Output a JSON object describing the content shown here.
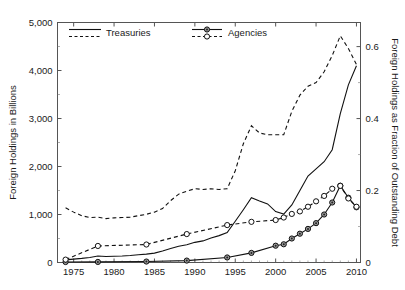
{
  "chart_data": {
    "type": "line",
    "title": "",
    "xlabel": "",
    "ylabel": "Foreign Holdings in Billions",
    "y2label": "Foreign Holdings as Fraction of Outstanding Debt",
    "xlim": [
      1973,
      2010.5
    ],
    "ylim": [
      0,
      5000
    ],
    "y2lim": [
      0,
      0.667
    ],
    "xticks": [
      1975,
      1980,
      1985,
      1990,
      1995,
      2000,
      2005,
      2010
    ],
    "xticklabels": [
      "1975",
      "1980",
      "1985",
      "1990",
      "1995",
      "2000",
      "2005",
      "2010"
    ],
    "yticks": [
      0,
      1000,
      2000,
      3000,
      4000,
      5000
    ],
    "yticklabels": [
      "0",
      "1,000",
      "2,000",
      "3,000",
      "4,000",
      "5,000"
    ],
    "y2ticks": [
      0,
      0.2,
      0.4,
      0.6
    ],
    "y2ticklabels": [
      "0",
      "0.2",
      "0.4",
      "0.6"
    ],
    "grid": false,
    "legend_position": "top-inside",
    "legend": [
      {
        "label": "Treasuries",
        "style": "solid-line",
        "axis": "left"
      },
      {
        "label": "Treasuries",
        "style": "dashed-line",
        "axis": "right"
      },
      {
        "label": "Agencies",
        "style": "solid-line-filled-circle",
        "axis": "left"
      },
      {
        "label": "Agencies",
        "style": "dashed-line-open-circle",
        "axis": "right"
      }
    ],
    "series": [
      {
        "name": "Treasuries (Billions)",
        "axis": "left",
        "style": "solid",
        "marker": "none",
        "x": [
          1974,
          1975,
          1976,
          1977,
          1978,
          1979,
          1980,
          1981,
          1982,
          1983,
          1984,
          1985,
          1986,
          1987,
          1988,
          1989,
          1990,
          1991,
          1992,
          1993,
          1994,
          1995,
          1996,
          1997,
          1998,
          1999,
          2000,
          2001,
          2002,
          2003,
          2004,
          2005,
          2006,
          2007,
          2008,
          2009,
          2010
        ],
        "y": [
          55,
          70,
          85,
          105,
          135,
          125,
          130,
          135,
          145,
          160,
          175,
          195,
          240,
          290,
          340,
          370,
          420,
          450,
          510,
          560,
          625,
          860,
          1100,
          1350,
          1280,
          1220,
          1060,
          1010,
          1200,
          1500,
          1800,
          1950,
          2100,
          2350,
          3100,
          3700,
          4100
        ]
      },
      {
        "name": "Treasuries (Fraction of Outstanding Debt)",
        "axis": "right",
        "style": "dashed",
        "marker": "none",
        "x": [
          1974,
          1975,
          1976,
          1977,
          1978,
          1979,
          1980,
          1981,
          1982,
          1983,
          1984,
          1985,
          1986,
          1987,
          1988,
          1989,
          1990,
          1991,
          1992,
          1993,
          1994,
          1995,
          1996,
          1997,
          1998,
          1999,
          2000,
          2001,
          2002,
          2003,
          2004,
          2005,
          2006,
          2007,
          2008,
          2009,
          2010
        ],
        "y": [
          0.152,
          0.14,
          0.13,
          0.125,
          0.126,
          0.122,
          0.124,
          0.125,
          0.126,
          0.13,
          0.134,
          0.14,
          0.15,
          0.172,
          0.19,
          0.198,
          0.205,
          0.203,
          0.205,
          0.203,
          0.205,
          0.255,
          0.33,
          0.38,
          0.36,
          0.355,
          0.355,
          0.355,
          0.42,
          0.465,
          0.49,
          0.5,
          0.53,
          0.575,
          0.63,
          0.595,
          0.55
        ]
      },
      {
        "name": "Agencies (Billions)",
        "axis": "left",
        "style": "solid",
        "marker": "filled-circle",
        "x": [
          1974,
          1978,
          1984,
          1989,
          1994,
          1997,
          2000,
          2001,
          2002,
          2003,
          2004,
          2005,
          2006,
          2007,
          2008,
          2009,
          2010
        ],
        "y": [
          10,
          12,
          20,
          40,
          105,
          200,
          350,
          380,
          500,
          600,
          700,
          820,
          1000,
          1250,
          1600,
          1350,
          1150
        ]
      },
      {
        "name": "Agencies (Fraction of Outstanding Debt)",
        "axis": "right",
        "style": "dashed",
        "marker": "open-circle",
        "x": [
          1974,
          1978,
          1984,
          1989,
          1994,
          1997,
          2000,
          2001,
          2002,
          2003,
          2004,
          2005,
          2006,
          2007,
          2008,
          2009,
          2010
        ],
        "y": [
          0.008,
          0.046,
          0.05,
          0.079,
          0.104,
          0.113,
          0.118,
          0.125,
          0.135,
          0.142,
          0.155,
          0.17,
          0.185,
          0.205,
          0.213,
          0.178,
          0.155
        ]
      }
    ]
  },
  "axes": {
    "left_title": "Foreign Holdings in Billions",
    "right_title": "Foreign Holdings as Fraction of Outstanding Debt"
  },
  "legend": {
    "treasuries_label": "Treasuries",
    "agencies_label": "Agencies"
  },
  "colors": {
    "line": "#111111",
    "axis": "#444444",
    "background": "#ffffff"
  }
}
